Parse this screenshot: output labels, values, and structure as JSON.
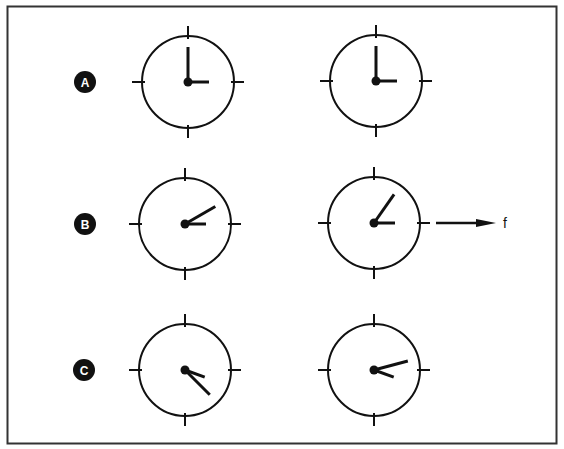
{
  "figure": {
    "stroke_color": "#111111",
    "background": "#ffffff",
    "rows": [
      {
        "label": "A",
        "clocks": [
          {
            "position": "left",
            "long_hand_deg": 0,
            "short_hand_deg": 90
          },
          {
            "position": "right",
            "long_hand_deg": 0,
            "short_hand_deg": 90
          }
        ],
        "force_arrow": null
      },
      {
        "label": "B",
        "clocks": [
          {
            "position": "left",
            "long_hand_deg": 60,
            "short_hand_deg": 90
          },
          {
            "position": "right",
            "long_hand_deg": 35,
            "short_hand_deg": 90
          }
        ],
        "force_arrow": {
          "direction": "right",
          "label": "f"
        }
      },
      {
        "label": "C",
        "clocks": [
          {
            "position": "left",
            "long_hand_deg": 135,
            "short_hand_deg": 110
          },
          {
            "position": "right",
            "long_hand_deg": 75,
            "short_hand_deg": 110
          }
        ],
        "force_arrow": null
      }
    ]
  }
}
